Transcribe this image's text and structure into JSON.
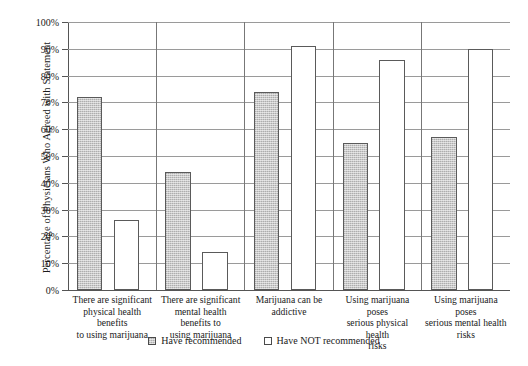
{
  "chart_data": {
    "type": "bar",
    "title": "",
    "xlabel": "",
    "ylabel": "Percentage of Physicians Who Agreed with Statement",
    "ylim": [
      0,
      100
    ],
    "ytick_labels": [
      "0%",
      "10%",
      "20%",
      "30%",
      "40%",
      "50%",
      "60%",
      "70%",
      "80%",
      "90%",
      "100%"
    ],
    "ytick_values": [
      0,
      10,
      20,
      30,
      40,
      50,
      60,
      70,
      80,
      90,
      100
    ],
    "grid": "horizontal",
    "legend_position": "bottom-center",
    "categories": [
      "There are significant physical health benefits to using marijuana",
      "There are significant mental health benefits to using marijuana",
      "Marijuana can be addictive",
      "Using marijuana poses serious physical health risks",
      "Using marijuana poses serious mental health risks"
    ],
    "series": [
      {
        "name": "Have recommended",
        "color": "#c9c9c9",
        "values": [
          72,
          44,
          74,
          55,
          57
        ]
      },
      {
        "name": "Have NOT recommended",
        "color": "#ffffff",
        "values": [
          26,
          14,
          91,
          86,
          90
        ]
      }
    ]
  },
  "axis": {
    "y_title": "Percentage of Physicians Who Agreed with Statement"
  },
  "x_labels": [
    {
      "lines": [
        "There are significant",
        "physical health benefits",
        "to using marijuana"
      ]
    },
    {
      "lines": [
        "There are significant",
        "mental health benefits to",
        "using marijuana"
      ]
    },
    {
      "lines": [
        "Marijuana can be",
        "addictive"
      ]
    },
    {
      "lines": [
        "Using marijuana poses",
        "serious physical health",
        "risks"
      ]
    },
    {
      "lines": [
        "Using marijuana poses",
        "serious mental health",
        "risks"
      ]
    }
  ],
  "legend": {
    "items": [
      {
        "label": "Have recommended",
        "swatch": "gray-filled-square"
      },
      {
        "label": "Have NOT recommended",
        "swatch": "white-empty-square"
      }
    ]
  }
}
